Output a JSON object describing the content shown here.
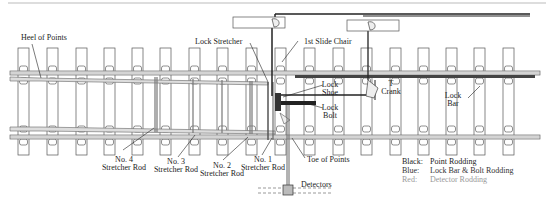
{
  "diagram": {
    "title_labels": {
      "heel_of_points": "Heel of Points",
      "lock_stretcher": "Lock Stretcher",
      "first_slide_chair": "1st Slide Chair",
      "lock_shoe_1": "Lock",
      "lock_shoe_2": "Shoe",
      "lock_bolt_1": "Lock",
      "lock_bolt_2": "Bolt",
      "t_crank_1": "T",
      "t_crank_2": "Crank",
      "lock_bar_1": "Lock",
      "lock_bar_2": "Bar",
      "toe_of_points": "Toe of Points",
      "detectors": "Detectors"
    },
    "stretcher_rods": [
      {
        "line1": "No. 4",
        "line2": "Stretcher Rod"
      },
      {
        "line1": "No. 3",
        "line2": "Stretcher Rod"
      },
      {
        "line1": "No. 2",
        "line2": "Stretcher Rod"
      },
      {
        "line1": "No. 1",
        "line2": "Stretcher Rod"
      }
    ],
    "legend": [
      {
        "key": "Black:",
        "value": "Point Rodding",
        "color": "#222222"
      },
      {
        "key": "Blue:",
        "value": "Lock Bar & Bolt Rodding",
        "color": "#333333"
      },
      {
        "key": "Red:",
        "value": "Detector Rodding",
        "color": "#999999"
      }
    ],
    "sleeper_x": [
      18,
      47,
      76,
      104,
      132,
      160,
      189,
      217,
      246,
      275,
      304,
      333,
      361,
      390,
      418,
      446,
      474,
      503
    ]
  }
}
